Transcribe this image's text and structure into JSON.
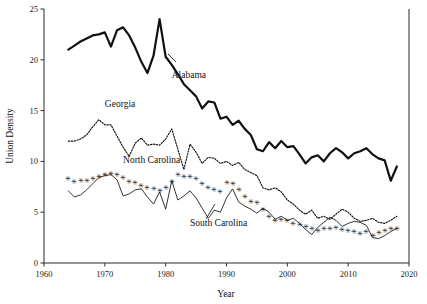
{
  "chart_data": {
    "type": "line",
    "title": "",
    "xlabel": "Year",
    "ylabel": "Union Density",
    "xlim": [
      1960,
      2020
    ],
    "ylim": [
      0,
      25
    ],
    "xticks": [
      1960,
      1970,
      1980,
      1990,
      2000,
      2010,
      2020
    ],
    "yticks": [
      0,
      5,
      10,
      15,
      20,
      25
    ],
    "grid": false,
    "legend_position": "inline-annotations",
    "annotations": [
      {
        "text": "Alabama",
        "x": 1981,
        "y": 18.2
      },
      {
        "text": "Georgia",
        "x": 1970,
        "y": 15.4
      },
      {
        "text": "North Carolina",
        "x": 1973,
        "y": 9.8
      },
      {
        "text": "South Carolina",
        "x": 1984,
        "y": 3.6
      }
    ],
    "x": [
      1964,
      1965,
      1966,
      1967,
      1968,
      1969,
      1970,
      1971,
      1972,
      1973,
      1974,
      1975,
      1976,
      1977,
      1978,
      1979,
      1980,
      1981,
      1982,
      1983,
      1984,
      1985,
      1986,
      1987,
      1988,
      1989,
      1990,
      1991,
      1992,
      1993,
      1994,
      1995,
      1996,
      1997,
      1998,
      1999,
      2000,
      2001,
      2002,
      2003,
      2004,
      2005,
      2006,
      2007,
      2008,
      2009,
      2010,
      2011,
      2012,
      2013,
      2014,
      2015,
      2016,
      2017,
      2018
    ],
    "series": [
      {
        "name": "Alabama",
        "style": "thick-solid",
        "values": [
          21.0,
          21.4,
          21.8,
          22.1,
          22.4,
          22.5,
          22.7,
          21.3,
          22.9,
          23.2,
          22.4,
          21.2,
          19.8,
          18.7,
          20.4,
          24.0,
          20.3,
          19.5,
          18.6,
          17.6,
          17.0,
          16.4,
          15.2,
          15.9,
          15.8,
          14.2,
          14.4,
          13.6,
          14.0,
          13.2,
          12.6,
          11.2,
          11.0,
          11.9,
          11.3,
          12.0,
          11.4,
          11.5,
          10.7,
          9.8,
          10.4,
          10.6,
          10.0,
          10.8,
          11.3,
          10.9,
          10.3,
          10.8,
          11.0,
          11.3,
          10.7,
          10.3,
          10.1,
          8.1,
          9.5
        ]
      },
      {
        "name": "Georgia",
        "style": "dotted",
        "values": [
          12.0,
          12.0,
          12.2,
          12.6,
          13.4,
          14.1,
          13.6,
          13.6,
          12.5,
          11.4,
          10.5,
          11.8,
          12.3,
          11.6,
          11.7,
          11.6,
          12.2,
          13.2,
          11.2,
          9.2,
          11.7,
          10.9,
          9.8,
          10.4,
          10.3,
          9.8,
          10.0,
          9.6,
          9.9,
          9.2,
          8.9,
          8.6,
          7.4,
          7.2,
          7.4,
          7.0,
          6.2,
          5.8,
          5.2,
          4.8,
          5.2,
          4.4,
          4.6,
          4.3,
          4.8,
          5.3,
          5.0,
          4.4,
          4.1,
          4.2,
          4.4,
          4.0,
          3.9,
          4.2,
          4.6
        ]
      },
      {
        "name": "North Carolina",
        "style": "star-markers",
        "values": [
          8.3,
          8.0,
          8.1,
          8.1,
          8.3,
          8.5,
          8.7,
          8.8,
          8.7,
          8.4,
          8.0,
          7.9,
          7.6,
          7.4,
          7.3,
          7.1,
          7.4,
          8.0,
          8.7,
          8.5,
          8.5,
          8.3,
          7.8,
          7.4,
          7.2,
          7.0,
          7.9,
          7.8,
          7.2,
          6.5,
          6.0,
          5.9,
          5.2,
          4.6,
          4.2,
          4.3,
          4.2,
          3.9,
          3.8,
          3.6,
          3.4,
          3.2,
          3.4,
          3.4,
          3.5,
          3.3,
          3.2,
          3.1,
          2.9,
          3.1,
          2.7,
          3.0,
          3.2,
          3.4,
          3.4
        ]
      },
      {
        "name": "South Carolina",
        "style": "thin-solid",
        "values": [
          7.1,
          6.5,
          6.7,
          7.2,
          7.8,
          8.4,
          8.6,
          8.7,
          8.2,
          6.6,
          6.8,
          7.2,
          7.3,
          6.5,
          5.8,
          7.0,
          5.3,
          8.1,
          6.2,
          6.6,
          7.1,
          6.4,
          5.4,
          4.4,
          5.2,
          5.0,
          6.4,
          7.3,
          6.0,
          5.6,
          5.3,
          4.9,
          5.4,
          5.0,
          4.3,
          4.6,
          4.2,
          4.4,
          3.9,
          3.3,
          2.8,
          3.5,
          4.0,
          4.5,
          4.2,
          3.6,
          3.9,
          4.1,
          4.0,
          3.7,
          2.5,
          2.4,
          2.7,
          3.1,
          3.4
        ]
      }
    ]
  }
}
